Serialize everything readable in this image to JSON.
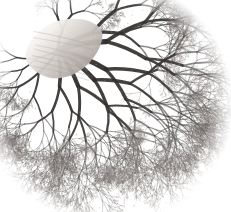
{
  "image": {
    "kind": "natural-image",
    "subject": "vascular-corrosion-cast",
    "caption": "Grayscale photograph of a branching vascular / bronchial corrosion cast specimen on a plain white background",
    "background_color": "#ffffff",
    "width": 231,
    "height": 212,
    "colorspace": "grayscale",
    "has_text": false,
    "has_axes": false,
    "has_legend": false,
    "has_scale_bar": false,
    "palette": {
      "background": "#ffffff",
      "stump_highlight": "#f2efec",
      "stump_midtone": "#cfc9c4",
      "stump_shadow": "#a79f99",
      "canopy_light": "#bdb9b6",
      "canopy_mid": "#8d8884",
      "canopy_dark": "#4a4644",
      "trunk_dark": "#2b2826",
      "darkest": "#1a1818"
    },
    "regions": [
      {
        "name": "hilum-stump",
        "description": "Smooth pale tapering stump / cut pedicle at the upper-left of the specimen",
        "center_x": 52,
        "center_y": 44,
        "tone": "light"
      },
      {
        "name": "primary-trunk",
        "description": "Thick dark main vessel descending and branching from the stump toward the centre",
        "center_x": 78,
        "center_y": 70,
        "tone": "dark"
      },
      {
        "name": "upper-spur",
        "description": "Narrow branch spike rising to the top edge near the right of centre",
        "center_x": 148,
        "center_y": 14,
        "tone": "mid"
      },
      {
        "name": "right-canopy",
        "description": "Dense fine arborization fanning right and fading to a feathered edge",
        "center_x": 168,
        "center_y": 100,
        "tone": "mid"
      },
      {
        "name": "lower-canopy",
        "description": "Dense fine arborization spreading down and left, feathered lower margin",
        "center_x": 100,
        "center_y": 155,
        "tone": "mid"
      },
      {
        "name": "left-lobe",
        "description": "Smaller sparse lobe of fine branches projecting to the lower-left",
        "center_x": 32,
        "center_y": 140,
        "tone": "light"
      }
    ],
    "bounds": {
      "left": 12,
      "top": 8,
      "right": 205,
      "bottom": 196
    },
    "structure": {
      "root_x": 58,
      "root_y": 50,
      "trunk_angle_deg": 35,
      "branch_generations": 9,
      "branch_angle_spread_deg": 54,
      "length_ratio": 0.74,
      "width_ratio": 0.7,
      "seed": 20240517,
      "tip_cloud_density": 5200,
      "primary_branches": [
        {
          "angle_deg": -78,
          "length": 54,
          "width": 3.0
        },
        {
          "angle_deg": -34,
          "length": 96,
          "width": 4.6
        },
        {
          "angle_deg": -8,
          "length": 122,
          "width": 5.2
        },
        {
          "angle_deg": 16,
          "length": 128,
          "width": 5.0
        },
        {
          "angle_deg": 42,
          "length": 118,
          "width": 4.8
        },
        {
          "angle_deg": 68,
          "length": 104,
          "width": 4.2
        },
        {
          "angle_deg": 96,
          "length": 92,
          "width": 3.6
        },
        {
          "angle_deg": 124,
          "length": 74,
          "width": 3.0
        },
        {
          "angle_deg": 152,
          "length": 58,
          "width": 2.4
        }
      ]
    }
  }
}
